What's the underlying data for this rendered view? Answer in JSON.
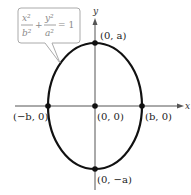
{
  "diagram": {
    "type": "ellipse-on-axes",
    "equation": {
      "term1_num": "x²",
      "term1_den": "b²",
      "plus": "+",
      "term2_num": "y²",
      "term2_den": "a²",
      "equals": "= 1"
    },
    "axes": {
      "x_label": "x",
      "y_label": "y"
    },
    "points": {
      "top": "(0, a)",
      "left": "(−b, 0)",
      "center": "(0, 0)",
      "right": "(b, 0)",
      "bottom": "(0, −a)"
    },
    "colors": {
      "curve": "#111111",
      "axes": "#555555",
      "callout_border": "#aaaaaa",
      "equation_text": "#8a8a8a"
    }
  }
}
